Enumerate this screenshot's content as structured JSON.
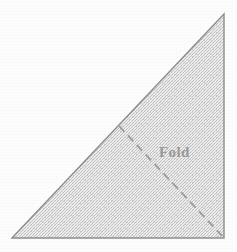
{
  "figure": {
    "canvas": {
      "width": 237,
      "height": 252,
      "background_color": "#fdfdfd"
    },
    "shape": {
      "name": "right-triangle",
      "fill_color": "#d9d9d9",
      "fill_style": "halftone-dither",
      "stroke_color": "#8e8e8e",
      "stroke_width": 1.4,
      "vertices": [
        {
          "label": "bottom-left",
          "x": 12,
          "y": 238
        },
        {
          "label": "top-right",
          "x": 224,
          "y": 14
        },
        {
          "label": "bottom-right",
          "x": 224,
          "y": 238
        }
      ]
    },
    "fold_line": {
      "label": "Fold",
      "stroke_color": "#9c9c9c",
      "stroke_width": 1.8,
      "dash_pattern": "8 5",
      "start": {
        "x": 119,
        "y": 126
      },
      "end": {
        "x": 224,
        "y": 238
      }
    },
    "label": {
      "text": "Fold",
      "color": "#9a9a9a",
      "x": 159,
      "y": 157,
      "font_size": 15
    }
  }
}
